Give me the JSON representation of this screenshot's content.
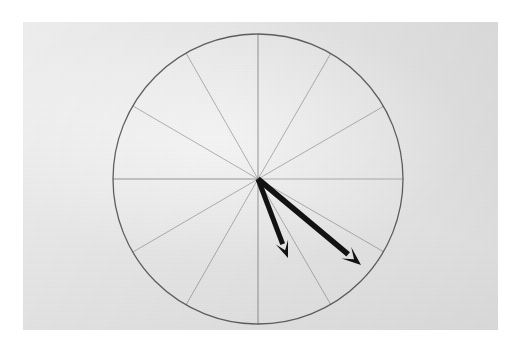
{
  "scene": {
    "description": "Photograph of a hand-drawn circle divided into twelve equal sectors with two bold arrows drawn from the centre",
    "page_background_color": "#ffffff",
    "paper_color": "#e8e8e8",
    "paper_region": {
      "x": 23,
      "y": 22,
      "width": 475,
      "height": 308
    }
  },
  "chart_data": {
    "type": "pie",
    "title": "",
    "subtitle": "",
    "xlabel": "",
    "ylabel": "",
    "legend_position": "none",
    "grid": false,
    "circle": {
      "center_x": 258,
      "center_y": 179,
      "radius": 145,
      "stroke_color": "#4a4a4a",
      "stroke_width": 1.3
    },
    "sector_count": 12,
    "sector_angle_degrees": 30,
    "categories": [
      "1",
      "2",
      "3",
      "4",
      "5",
      "6",
      "7",
      "8",
      "9",
      "10",
      "11",
      "12"
    ],
    "values": [
      30,
      30,
      30,
      30,
      30,
      30,
      30,
      30,
      30,
      30,
      30,
      30
    ],
    "spokes": [
      {
        "name": "spoke-0deg",
        "angle_degrees": 0,
        "end_x": 403,
        "end_y": 179,
        "weight": "light"
      },
      {
        "name": "spoke-30deg",
        "angle_degrees": 30,
        "end_x": 384,
        "end_y": 106,
        "weight": "light"
      },
      {
        "name": "spoke-60deg",
        "angle_degrees": 60,
        "end_x": 331,
        "end_y": 53,
        "weight": "light"
      },
      {
        "name": "spoke-90deg",
        "angle_degrees": 90,
        "end_x": 258,
        "end_y": 34,
        "weight": "medium"
      },
      {
        "name": "spoke-120deg",
        "angle_degrees": 120,
        "end_x": 186,
        "end_y": 53,
        "weight": "light"
      },
      {
        "name": "spoke-150deg",
        "angle_degrees": 150,
        "end_x": 133,
        "end_y": 106,
        "weight": "light"
      },
      {
        "name": "spoke-180deg",
        "angle_degrees": 180,
        "end_x": 113,
        "end_y": 179,
        "weight": "medium"
      },
      {
        "name": "spoke-210deg",
        "angle_degrees": 210,
        "end_x": 133,
        "end_y": 252,
        "weight": "light"
      },
      {
        "name": "spoke-240deg",
        "angle_degrees": 240,
        "end_x": 186,
        "end_y": 305,
        "weight": "light"
      },
      {
        "name": "spoke-270deg",
        "angle_degrees": 270,
        "end_x": 258,
        "end_y": 324,
        "weight": "medium"
      },
      {
        "name": "spoke-300deg",
        "angle_degrees": 300,
        "end_x": 331,
        "end_y": 305,
        "weight": "light"
      },
      {
        "name": "spoke-330deg",
        "angle_degrees": 330,
        "end_x": 384,
        "end_y": 252,
        "weight": "light"
      }
    ],
    "arrows": [
      {
        "name": "arrow-1",
        "start_x": 258,
        "start_y": 179,
        "tip_x": 288,
        "tip_y": 258,
        "angle_degrees": -69,
        "length": 84,
        "color": "#121212",
        "stroke_width": 5.0,
        "head_length": 17,
        "head_width": 13
      },
      {
        "name": "arrow-2",
        "start_x": 258,
        "start_y": 179,
        "tip_x": 361,
        "tip_y": 265,
        "angle_degrees": -40,
        "length": 134,
        "color": "#121212",
        "stroke_width": 5.6,
        "head_length": 19,
        "head_width": 15
      }
    ]
  }
}
